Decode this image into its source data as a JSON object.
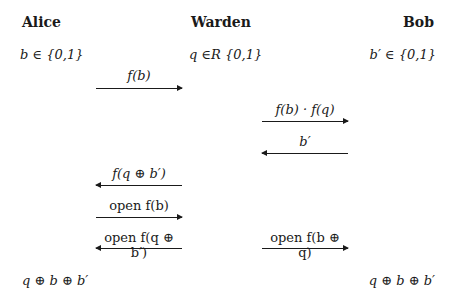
{
  "parties": {
    "alice": {
      "name": "Alice",
      "init": "b ∈ {0,1}",
      "result": "q ⊕ b ⊕ b′"
    },
    "warden": {
      "name": "Warden",
      "init": "q ∈R {0,1}"
    },
    "bob": {
      "name": "Bob",
      "init": "b′ ∈ {0,1}",
      "result": "q ⊕ b ⊕ b′"
    }
  },
  "messages": [
    {
      "label": "f(b)",
      "from": "Alice",
      "to": "Warden",
      "direction": "right"
    },
    {
      "label": "f(b) · f(q)",
      "from": "Warden",
      "to": "Bob",
      "direction": "right"
    },
    {
      "label": "b′",
      "from": "Bob",
      "to": "Warden",
      "direction": "left"
    },
    {
      "label": "f(q ⊕ b′)",
      "from": "Warden",
      "to": "Alice",
      "direction": "left"
    },
    {
      "label": "open f(b)",
      "from": "Alice",
      "to": "Warden",
      "direction": "right"
    },
    {
      "label": "open f(q ⊕ b′)",
      "from": "Warden",
      "to": "Alice",
      "direction": "left"
    },
    {
      "label": "open f(b ⊕ q)",
      "from": "Warden",
      "to": "Bob",
      "direction": "right"
    }
  ]
}
